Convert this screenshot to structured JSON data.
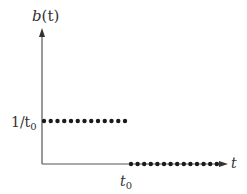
{
  "chart_data": {
    "type": "scatter",
    "title": "",
    "xlabel": "t",
    "ylabel": "b(t)",
    "x_ticks": [
      "t_0"
    ],
    "y_ticks": [
      "1/t_0"
    ],
    "grid": false,
    "legend": null,
    "series": [
      {
        "name": "b(t) for t < t_0",
        "y_value_label": "1/t_0",
        "x_range": [
          0,
          "t_0"
        ],
        "points": 13,
        "marker": "dot"
      },
      {
        "name": "b(t) for t > t_0",
        "y_value": 0,
        "x_range": [
          "t_0",
          "inf"
        ],
        "points": 14,
        "marker": "dot"
      }
    ],
    "color": "#1a1a1a",
    "axis_color": "#555555"
  },
  "labels": {
    "y_axis": "b(t)",
    "x_axis": "t",
    "y_tick_prefix": "1/t",
    "y_tick_sub": "0",
    "x_tick_main": "t",
    "x_tick_sub": "0",
    "y_axis_main": "b",
    "y_axis_paren": "(t)"
  }
}
